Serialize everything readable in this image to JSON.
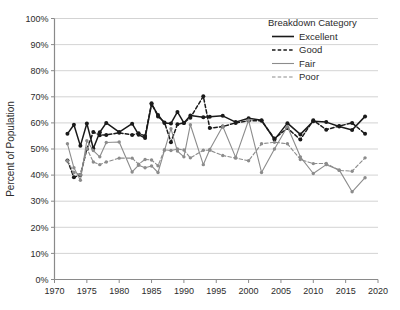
{
  "chart_data": {
    "type": "line",
    "title": "",
    "xlabel": "",
    "ylabel": "Percent of Population",
    "xlim": [
      1970,
      2020
    ],
    "ylim": [
      0,
      100
    ],
    "grid": true,
    "legend_position": "top-right",
    "legend_title": "Breakdown Category",
    "x_ticks": [
      "1970",
      "1975",
      "1980",
      "1985",
      "1990",
      "1995",
      "2000",
      "2005",
      "2010",
      "2015",
      "2020"
    ],
    "x_tick_values": [
      1970,
      1975,
      1980,
      1985,
      1990,
      1995,
      2000,
      2005,
      2010,
      2015,
      2020
    ],
    "y_ticks": [
      "0%",
      "10%",
      "20%",
      "30%",
      "40%",
      "50%",
      "60%",
      "70%",
      "80%",
      "90%",
      "100%"
    ],
    "y_tick_values": [
      0,
      10,
      20,
      30,
      40,
      50,
      60,
      70,
      80,
      90,
      100
    ],
    "series": [
      {
        "name": "Excellent",
        "color": "#1a1a1a",
        "dash": "none",
        "x": [
          1972,
          1973,
          1974,
          1975,
          1976,
          1977,
          1978,
          1980,
          1982,
          1983,
          1984,
          1985,
          1986,
          1987,
          1988,
          1989,
          1990,
          1991,
          1993,
          1994,
          1996,
          1998,
          2000,
          2002,
          2004,
          2006,
          2008,
          2010,
          2012,
          2014,
          2016,
          2018
        ],
        "values": [
          55.8,
          59.3,
          51.2,
          59.8,
          50.2,
          56.4,
          60.0,
          56.5,
          59.7,
          55.5,
          54.2,
          67.2,
          63.0,
          60.0,
          59.8,
          64.2,
          60.0,
          62.8,
          62.2,
          62.4,
          62.7,
          60.3,
          61.8,
          61.0,
          53.6,
          59.9,
          55.6,
          60.6,
          60.3,
          58.6,
          57.3,
          62.5
        ]
      },
      {
        "name": "Good",
        "color": "#1a1a1a",
        "dash": "dashed",
        "x": [
          1972,
          1973,
          1974,
          1975,
          1976,
          1977,
          1978,
          1980,
          1982,
          1983,
          1984,
          1985,
          1986,
          1987,
          1988,
          1989,
          1990,
          1991,
          1993,
          1994,
          1996,
          1998,
          2000,
          2002,
          2004,
          2006,
          2008,
          2010,
          2012,
          2014,
          2016,
          2018
        ],
        "values": [
          45.6,
          39.2,
          40.0,
          50.0,
          56.5,
          55.3,
          55.4,
          56.2,
          55.4,
          56.0,
          55.0,
          67.5,
          62.5,
          60.2,
          52.6,
          59.5,
          60.0,
          62.0,
          70.2,
          58.0,
          58.6,
          60.0,
          60.8,
          60.8,
          54.0,
          58.0,
          53.6,
          61.0,
          57.4,
          58.8,
          60.0,
          55.8
        ]
      },
      {
        "name": "Fair",
        "color": "#8c8c8c",
        "dash": "none",
        "x": [
          1972,
          1973,
          1974,
          1975,
          1976,
          1977,
          1978,
          1980,
          1982,
          1983,
          1984,
          1985,
          1986,
          1987,
          1988,
          1989,
          1990,
          1991,
          1993,
          1994,
          1996,
          1998,
          2000,
          2002,
          2004,
          2006,
          2008,
          2010,
          2012,
          2014,
          2016,
          2018
        ],
        "values": [
          52.0,
          42.8,
          38.0,
          53.2,
          49.4,
          47.0,
          52.5,
          52.7,
          41.2,
          43.8,
          42.8,
          43.5,
          41.0,
          49.5,
          57.8,
          49.2,
          47.0,
          59.3,
          44.0,
          49.8,
          58.7,
          46.8,
          61.0,
          41.0,
          50.0,
          58.6,
          47.0,
          40.6,
          44.0,
          42.0,
          33.6,
          39.0
        ]
      },
      {
        "name": "Poor",
        "color": "#8c8c8c",
        "dash": "dashed",
        "x": [
          1972,
          1973,
          1974,
          1975,
          1976,
          1977,
          1978,
          1980,
          1982,
          1983,
          1984,
          1985,
          1986,
          1987,
          1988,
          1989,
          1990,
          1991,
          1993,
          1994,
          1996,
          1998,
          2000,
          2002,
          2004,
          2006,
          2008,
          2010,
          2012,
          2014,
          2016,
          2018
        ],
        "values": [
          45.5,
          41.0,
          40.2,
          50.2,
          45.0,
          44.0,
          45.0,
          46.5,
          46.5,
          44.2,
          46.0,
          45.8,
          43.6,
          49.7,
          49.4,
          50.0,
          49.6,
          46.6,
          49.5,
          49.5,
          47.5,
          46.5,
          45.5,
          52.0,
          52.6,
          52.0,
          46.0,
          44.4,
          44.5,
          41.8,
          41.5,
          46.6
        ]
      }
    ]
  },
  "legend": {
    "title": "Breakdown Category",
    "entries": [
      {
        "label": "Excellent",
        "color": "#1a1a1a",
        "dash": "none"
      },
      {
        "label": "Good",
        "color": "#1a1a1a",
        "dash": "dashed"
      },
      {
        "label": "Fair",
        "color": "#8c8c8c",
        "dash": "none"
      },
      {
        "label": "Poor",
        "color": "#8c8c8c",
        "dash": "dashed"
      }
    ]
  },
  "axes": {
    "y_title": "Percent of Population"
  }
}
